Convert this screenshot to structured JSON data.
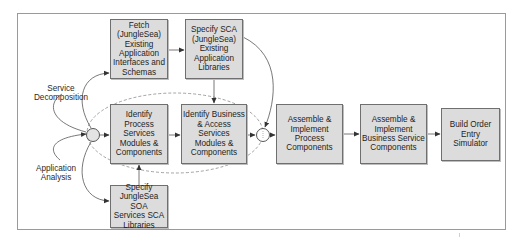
{
  "diagram": {
    "type": "process-flow",
    "colors": {
      "box_fill": "#dcdcdc",
      "box_border": "#6f6f6f",
      "line": "#555555",
      "dashed_group": "#8a8a8a",
      "junction_fill": "#e4e4e4"
    },
    "inputs": {
      "service_decomposition": "Service Decomposition",
      "application_analysis_line1": "Application",
      "application_analysis_line2": "Analysis"
    },
    "boxes": {
      "fetch": [
        "Fetch",
        "(JungleSea)",
        "Existing",
        "Application",
        "Interfaces and",
        "Schemas"
      ],
      "specify_sca": [
        "Specify SCA",
        "(JungleSea)",
        "Existing",
        "Application",
        "Libraries"
      ],
      "identify_process": [
        "Identify Process",
        "Services",
        "Modules &",
        "Components"
      ],
      "identify_business": [
        "Identify Business",
        "& Access",
        "Services",
        "Modules &",
        "Components"
      ],
      "specify_junglesea": [
        "Specify",
        "JungleSea SOA",
        "Services SCA",
        "Libraries"
      ],
      "assemble_process": [
        "Assemble &",
        "Implement",
        "Process",
        "Components"
      ],
      "assemble_business": [
        "Assemble &",
        "Implement",
        "Business Service",
        "Components"
      ],
      "build_order": [
        "Build Order",
        "Entry",
        "Simulator"
      ]
    },
    "edges": [
      {
        "from": "Service Decomposition / Application Analysis",
        "to": "start-junction"
      },
      {
        "from": "start-junction",
        "to": "Fetch (JungleSea) Existing Application Interfaces and Schemas"
      },
      {
        "from": "start-junction",
        "to": "Identify Process Services Modules & Components"
      },
      {
        "from": "start-junction",
        "to": "Specify JungleSea SOA Services SCA Libraries"
      },
      {
        "from": "Fetch",
        "to": "Specify SCA (JungleSea) Existing Application Libraries"
      },
      {
        "from": "Specify SCA",
        "to": "Identify Business & Access Services Modules & Components"
      },
      {
        "from": "Specify SCA",
        "to": "merge-junction"
      },
      {
        "from": "Specify JungleSea SOA Services SCA Libraries",
        "to": "Identify Process Services Modules & Components"
      },
      {
        "from": "Identify Process",
        "to": "Identify Business"
      },
      {
        "from": "Identify Business",
        "to": "merge-junction"
      },
      {
        "from": "merge-junction",
        "to": "Assemble & Implement Process Components"
      },
      {
        "from": "Assemble & Implement Process Components",
        "to": "Assemble & Implement Business Service Components"
      },
      {
        "from": "Assemble & Implement Business Service Components",
        "to": "Build Order Entry Simulator"
      }
    ]
  }
}
